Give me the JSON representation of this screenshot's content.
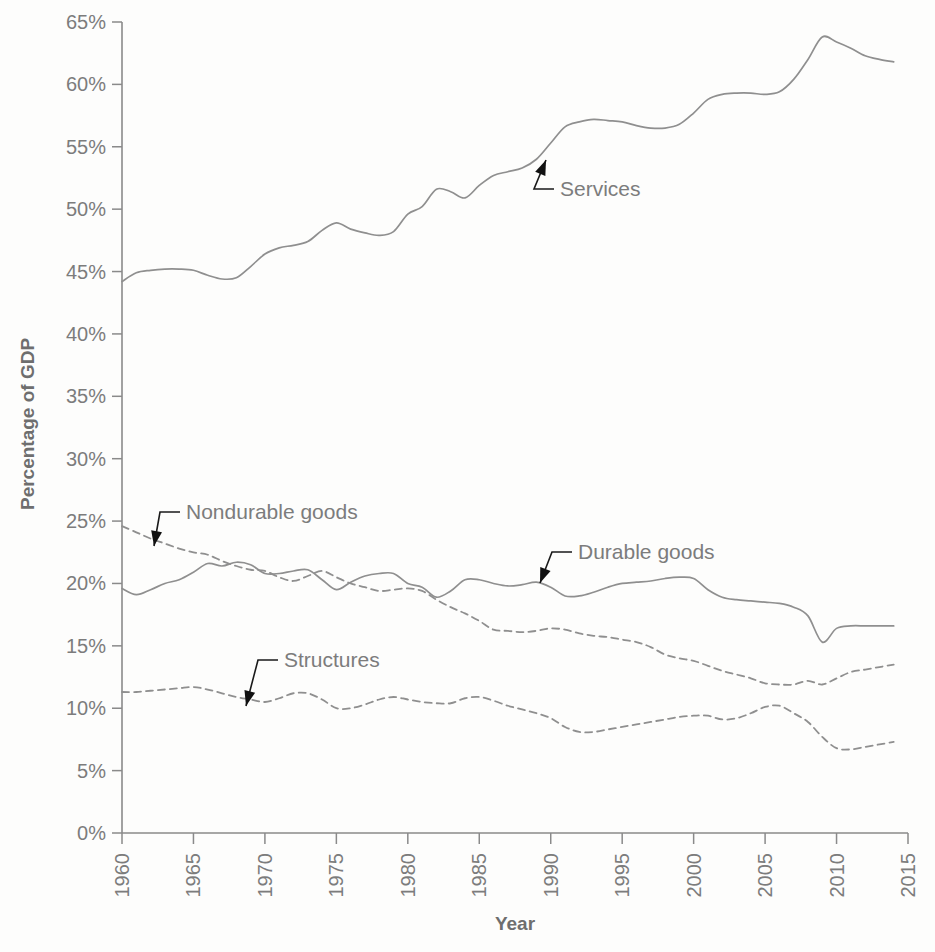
{
  "chart_data": {
    "type": "line",
    "title": "",
    "xlabel": "Year",
    "ylabel": "Percentage of GDP",
    "xlim": [
      1960,
      2015
    ],
    "ylim": [
      0,
      65
    ],
    "grid": false,
    "legend_position": "inline-annotations",
    "x_tick_labels": [
      "1960",
      "1965",
      "1970",
      "1975",
      "1980",
      "1985",
      "1990",
      "1995",
      "2000",
      "2005",
      "2010",
      "2015"
    ],
    "x_ticks": [
      1960,
      1965,
      1970,
      1975,
      1980,
      1985,
      1990,
      1995,
      2000,
      2005,
      2010,
      2015
    ],
    "y_tick_labels": [
      "0%",
      "5%",
      "10%",
      "15%",
      "20%",
      "25%",
      "30%",
      "35%",
      "40%",
      "45%",
      "50%",
      "55%",
      "60%",
      "65%"
    ],
    "y_ticks": [
      0,
      5,
      10,
      15,
      20,
      25,
      30,
      35,
      40,
      45,
      50,
      55,
      60,
      65
    ],
    "x": [
      1960,
      1961,
      1962,
      1963,
      1964,
      1965,
      1966,
      1967,
      1968,
      1969,
      1970,
      1971,
      1972,
      1973,
      1974,
      1975,
      1976,
      1977,
      1978,
      1979,
      1980,
      1981,
      1982,
      1983,
      1984,
      1985,
      1986,
      1987,
      1988,
      1989,
      1990,
      1991,
      1992,
      1993,
      1994,
      1995,
      1996,
      1997,
      1998,
      1999,
      2000,
      2001,
      2002,
      2003,
      2004,
      2005,
      2006,
      2007,
      2008,
      2009,
      2010,
      2011,
      2012,
      2013,
      2014
    ],
    "series": [
      {
        "name": "Services",
        "style": "solid",
        "annotation": "Services",
        "values": [
          44.2,
          44.9,
          45.1,
          45.2,
          45.2,
          45.1,
          44.7,
          44.4,
          44.5,
          45.4,
          46.4,
          46.9,
          47.1,
          47.4,
          48.3,
          48.9,
          48.4,
          48.1,
          47.9,
          48.2,
          49.6,
          50.2,
          51.6,
          51.4,
          50.9,
          51.9,
          52.7,
          53.0,
          53.3,
          54.0,
          55.3,
          56.6,
          57.0,
          57.2,
          57.1,
          57.0,
          56.7,
          56.5,
          56.5,
          56.8,
          57.7,
          58.8,
          59.2,
          59.3,
          59.3,
          59.2,
          59.4,
          60.4,
          62.0,
          63.8,
          63.4,
          62.9,
          62.3,
          62.0,
          61.8
        ]
      },
      {
        "name": "Durable goods",
        "style": "solid",
        "annotation": "Durable goods",
        "values": [
          19.6,
          19.1,
          19.5,
          20.0,
          20.3,
          20.9,
          21.6,
          21.4,
          21.7,
          21.5,
          20.8,
          20.8,
          21.0,
          21.1,
          20.3,
          19.5,
          20.1,
          20.6,
          20.8,
          20.8,
          20.0,
          19.7,
          18.9,
          19.4,
          20.3,
          20.3,
          20.0,
          19.8,
          19.9,
          20.1,
          19.7,
          19.0,
          19.0,
          19.3,
          19.7,
          20.0,
          20.1,
          20.2,
          20.4,
          20.5,
          20.4,
          19.5,
          18.9,
          18.7,
          18.6,
          18.5,
          18.4,
          18.1,
          17.4,
          15.3,
          16.4,
          16.6,
          16.6,
          16.6,
          16.6
        ]
      },
      {
        "name": "Nondurable goods",
        "style": "dashed",
        "annotation": "Nondurable goods",
        "values": [
          24.6,
          24.1,
          23.6,
          23.2,
          22.8,
          22.5,
          22.3,
          21.8,
          21.4,
          21.1,
          21.0,
          20.5,
          20.2,
          20.6,
          21.0,
          20.5,
          20.0,
          19.7,
          19.4,
          19.5,
          19.6,
          19.4,
          18.7,
          18.1,
          17.6,
          17.0,
          16.3,
          16.2,
          16.1,
          16.2,
          16.4,
          16.3,
          16.0,
          15.8,
          15.7,
          15.5,
          15.3,
          14.9,
          14.3,
          14.0,
          13.8,
          13.4,
          13.0,
          12.7,
          12.4,
          12.0,
          11.9,
          11.9,
          12.2,
          11.9,
          12.4,
          12.9,
          13.1,
          13.3,
          13.5
        ]
      },
      {
        "name": "Structures",
        "style": "dashed",
        "annotation": "Structures",
        "values": [
          11.3,
          11.3,
          11.4,
          11.5,
          11.6,
          11.7,
          11.5,
          11.2,
          10.9,
          10.7,
          10.5,
          10.8,
          11.2,
          11.2,
          10.7,
          10.0,
          10.0,
          10.3,
          10.7,
          10.9,
          10.7,
          10.5,
          10.4,
          10.4,
          10.8,
          10.9,
          10.6,
          10.2,
          9.9,
          9.6,
          9.2,
          8.5,
          8.1,
          8.1,
          8.3,
          8.5,
          8.7,
          8.9,
          9.1,
          9.3,
          9.4,
          9.4,
          9.1,
          9.2,
          9.6,
          10.1,
          10.2,
          9.6,
          8.9,
          7.7,
          6.8,
          6.7,
          6.9,
          7.1,
          7.3
        ]
      }
    ],
    "annotations": [
      {
        "label": "Services",
        "text_x": 560,
        "text_y": 196,
        "point_x": 546,
        "point_y": 160
      },
      {
        "label": "Nondurable goods",
        "text_x": 186,
        "text_y": 519,
        "point_x": 154,
        "point_y": 546
      },
      {
        "label": "Durable goods",
        "text_x": 578,
        "text_y": 559,
        "point_x": 540,
        "point_y": 583
      },
      {
        "label": "Structures",
        "text_x": 284,
        "text_y": 667,
        "point_x": 246,
        "point_y": 706
      }
    ]
  },
  "colors": {
    "line": "#8f8f8f",
    "axis": "#8a8a8a",
    "tick_text": "#7c7c7c",
    "axis_title": "#6e6e6e",
    "annotation_text": "#7c7c7c",
    "leader": "#111111",
    "background": "#fdfdfc"
  }
}
